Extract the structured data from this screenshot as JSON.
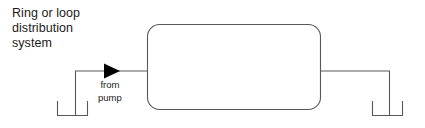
{
  "figure": {
    "width": 425,
    "height": 128,
    "background_color": "#ffffff",
    "stroke_color": "#58585a",
    "arrow_color": "#000000",
    "text_color": "#1a1a1a"
  },
  "caption": {
    "title_lines": [
      "Ring or loop",
      "distribution",
      "system"
    ],
    "title_text": "Ring or loop\ndistribution\nsystem"
  },
  "labels": {
    "from_pump_lines": [
      "from",
      "pump"
    ],
    "from_pump_text": "from\npump"
  },
  "shapes": {
    "loop_main": {
      "name": "rounded-rectangle-loop-main",
      "x": 147,
      "y": 24,
      "width": 174,
      "height": 86,
      "corner_radius": 12
    },
    "inlet_pipe": {
      "name": "inlet-pipe-from-pump",
      "points": "75,116 75,71 147,71",
      "arrow_tip_x": 120,
      "arrow_base_x": 104,
      "arrow_y": 71
    },
    "outlet_pipe": {
      "name": "outlet-pipe-to-service",
      "points": "321,71 389,71 389,116"
    },
    "left_bracket": {
      "name": "left-branch-bracket",
      "points": "57,101 57,116 88,116 88,101"
    },
    "right_bracket": {
      "name": "right-branch-bracket",
      "points": "372,101 372,116 403,116 403,101"
    }
  }
}
